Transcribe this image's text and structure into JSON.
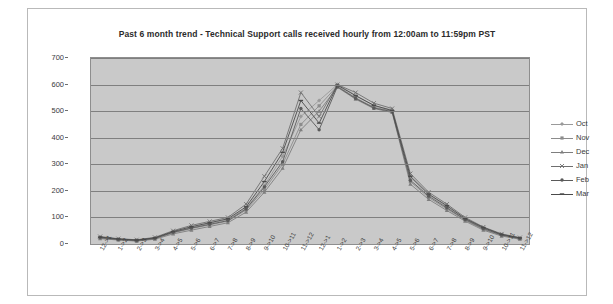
{
  "chart_data": {
    "type": "line",
    "title": "Past 6 month trend - Technical Support calls received hourly from 12:00am to 11:59pm PST",
    "xlabel": "",
    "ylabel": "",
    "ylim": [
      0,
      700
    ],
    "yticks": [
      0,
      100,
      200,
      300,
      400,
      500,
      600,
      700
    ],
    "grid": true,
    "legend_position": "right",
    "categories": [
      "12->1",
      "1->2",
      "2->3",
      "3->4",
      "4->5",
      "5->6",
      "6->7",
      "7->8",
      "8->9",
      "9->10",
      "10->11",
      "11->12",
      "12->1",
      "1->2",
      "2->3",
      "3->4",
      "4->5",
      "5->6",
      "6->7",
      "7->8",
      "8->9",
      "9->10",
      "10->11",
      "11->12"
    ],
    "series": [
      {
        "name": "Oct",
        "color": "#9a9a9a",
        "values": [
          25,
          18,
          14,
          22,
          45,
          62,
          78,
          92,
          135,
          220,
          330,
          480,
          540,
          600,
          560,
          520,
          505,
          250,
          185,
          140,
          95,
          60,
          35,
          22
        ]
      },
      {
        "name": "Nov",
        "color": "#8c8c8c",
        "values": [
          22,
          16,
          12,
          20,
          42,
          58,
          72,
          86,
          128,
          205,
          300,
          450,
          520,
          595,
          550,
          515,
          500,
          235,
          175,
          132,
          90,
          55,
          32,
          20
        ]
      },
      {
        "name": "Dec",
        "color": "#7e7e7e",
        "values": [
          20,
          15,
          11,
          18,
          38,
          52,
          66,
          80,
          120,
          195,
          285,
          430,
          500,
          590,
          545,
          510,
          495,
          225,
          168,
          126,
          86,
          52,
          30,
          18
        ]
      },
      {
        "name": "Jan",
        "color": "#6f6f6f",
        "values": [
          28,
          20,
          16,
          25,
          50,
          70,
          85,
          100,
          150,
          255,
          360,
          570,
          480,
          600,
          570,
          530,
          510,
          265,
          195,
          150,
          100,
          64,
          38,
          24
        ]
      },
      {
        "name": "Feb",
        "color": "#5a5a5a",
        "values": [
          24,
          17,
          13,
          21,
          44,
          60,
          74,
          88,
          132,
          215,
          310,
          510,
          430,
          592,
          548,
          512,
          498,
          240,
          180,
          136,
          92,
          58,
          34,
          21
        ]
      },
      {
        "name": "Mar",
        "color": "#4a4a4a",
        "values": [
          26,
          19,
          15,
          23,
          47,
          65,
          80,
          95,
          140,
          235,
          345,
          540,
          455,
          598,
          558,
          522,
          502,
          255,
          188,
          144,
          96,
          62,
          36,
          23
        ]
      }
    ]
  },
  "legend": {
    "items": [
      {
        "label": "Oct"
      },
      {
        "label": "Nov"
      },
      {
        "label": "Dec"
      },
      {
        "label": "Jan"
      },
      {
        "label": "Feb"
      },
      {
        "label": "Mar"
      }
    ]
  }
}
